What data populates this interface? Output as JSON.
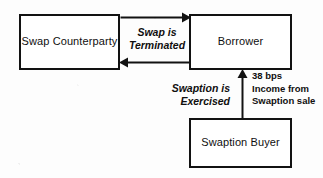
{
  "diagram": {
    "nodes": [
      {
        "id": "swap-counterparty",
        "label": "Swap\nCounterparty"
      },
      {
        "id": "borrower",
        "label": "Borrower"
      },
      {
        "id": "swaption-buyer",
        "label": "Swaption\nBuyer"
      }
    ],
    "edges": [
      {
        "id": "swap-terminated",
        "from": "swap-counterparty",
        "to": "borrower",
        "label": "Swap is\nTerminated",
        "style": "italic",
        "direction": "bidirectional"
      },
      {
        "id": "swaption-exercised",
        "from": "swaption-buyer",
        "to": "borrower",
        "label": "Swaption is\nExercised",
        "style": "italic",
        "direction": "up"
      }
    ],
    "annotations": [
      {
        "id": "income",
        "label": "38 bps\nIncome from\nSwaption sale",
        "attached_to": "swaption-exercised",
        "basis_points": 38
      }
    ],
    "colors": {
      "stroke": "#121212",
      "text": "#100f0f",
      "node_fill": "#ffffff",
      "background": "#fdfdfd"
    }
  }
}
